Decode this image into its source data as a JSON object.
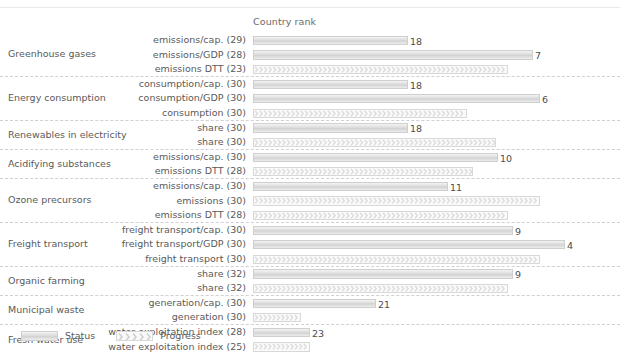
{
  "header": {
    "column_title": "Country rank"
  },
  "legend": {
    "status_label": "Status",
    "progress_label": "Progress",
    "status_swatch_icon": "solid-bar-swatch",
    "progress_swatch_icon": "chevron-bar-swatch"
  },
  "colors": {
    "status_fill": "#dcdcdc",
    "progress_fill": "#fafafa",
    "progress_chevron": "#dcdcdc",
    "bar_border": "#d2d2d2",
    "separator": "#cfcfd4",
    "text": "#5a5a5a",
    "background": "#ffffff"
  },
  "chart_data": {
    "type": "bar",
    "title": "",
    "xlabel": "Country rank",
    "ylabel": "",
    "grid": false,
    "legend_position": "bottom-left",
    "xlim": [
      1,
      32
    ],
    "note": "Horizontal bar chart; longer bar = better (lower) country rank. Two series: Status (solid) and Progress (chevron-hatched). Parenthetical number after each indicator label is the number of countries ranked.",
    "series": [
      {
        "name": "Status",
        "style": "solid"
      },
      {
        "name": "Progress",
        "style": "chevron"
      }
    ],
    "groups": [
      {
        "group": "Greenhouse gases",
        "rows": [
          {
            "label": "emissions/cap. (29)",
            "countries_ranked": 29,
            "series": "Status",
            "rank": 18,
            "bar_px": 155
          },
          {
            "label": "emissions/GDP (28)",
            "countries_ranked": 28,
            "series": "Status",
            "rank": 7,
            "bar_px": 280
          },
          {
            "label": "emissions DTT (23)",
            "countries_ranked": 23,
            "series": "Progress",
            "rank": 9,
            "bar_px": 255
          }
        ]
      },
      {
        "group": "Energy consumption",
        "rows": [
          {
            "label": "consumption/cap. (30)",
            "countries_ranked": 30,
            "series": "Status",
            "rank": 18,
            "bar_px": 155
          },
          {
            "label": "consumption/GDP (30)",
            "countries_ranked": 30,
            "series": "Status",
            "rank": 6,
            "bar_px": 287
          },
          {
            "label": "consumption (30)",
            "countries_ranked": 30,
            "series": "Progress",
            "rank": 13,
            "bar_px": 214
          }
        ]
      },
      {
        "group": "Renewables in electricity",
        "rows": [
          {
            "label": "share (30)",
            "countries_ranked": 30,
            "series": "Status",
            "rank": 18,
            "bar_px": 155
          },
          {
            "label": "share (30)",
            "countries_ranked": 30,
            "series": "Progress",
            "rank": 10,
            "bar_px": 243
          }
        ]
      },
      {
        "group": "Acidifying substances",
        "rows": [
          {
            "label": "emissions/cap. (30)",
            "countries_ranked": 30,
            "series": "Status",
            "rank": 10,
            "bar_px": 245
          },
          {
            "label": "emissions DTT (28)",
            "countries_ranked": 28,
            "series": "Progress",
            "rank": 12,
            "bar_px": 220
          }
        ]
      },
      {
        "group": "Ozone precursors",
        "rows": [
          {
            "label": "emissions/cap. (30)",
            "countries_ranked": 30,
            "series": "Status",
            "rank": 11,
            "bar_px": 195
          },
          {
            "label": "emissions (30)",
            "countries_ranked": 30,
            "series": "Progress",
            "rank": 6,
            "bar_px": 287
          },
          {
            "label": "emissions DTT (28)",
            "countries_ranked": 28,
            "series": "Progress",
            "rank": 9,
            "bar_px": 255
          }
        ]
      },
      {
        "group": "Freight transport",
        "rows": [
          {
            "label": "freight transport/cap. (30)",
            "countries_ranked": 30,
            "series": "Status",
            "rank": 9,
            "bar_px": 260
          },
          {
            "label": "freight transport/GDP (30)",
            "countries_ranked": 30,
            "series": "Status",
            "rank": 4,
            "bar_px": 312
          },
          {
            "label": "freight transport (30)",
            "countries_ranked": 30,
            "series": "Progress",
            "rank": 6,
            "bar_px": 287
          }
        ]
      },
      {
        "group": "Organic farming",
        "rows": [
          {
            "label": "share (32)",
            "countries_ranked": 32,
            "series": "Status",
            "rank": 9,
            "bar_px": 260
          },
          {
            "label": "share (32)",
            "countries_ranked": 32,
            "series": "Progress",
            "rank": 9,
            "bar_px": 255
          }
        ]
      },
      {
        "group": "Municipal waste",
        "rows": [
          {
            "label": "generation/cap. (30)",
            "countries_ranked": 30,
            "series": "Status",
            "rank": 21,
            "bar_px": 123
          },
          {
            "label": "generation (30)",
            "countries_ranked": 30,
            "series": "Progress",
            "rank": 27,
            "bar_px": 48
          }
        ]
      },
      {
        "group": "Fresh water use",
        "rows": [
          {
            "label": "water exploitation index (28)",
            "countries_ranked": 28,
            "series": "Status",
            "rank": 23,
            "bar_px": 57
          },
          {
            "label": "water exploitation index (25)",
            "countries_ranked": 25,
            "series": "Progress",
            "rank": 23,
            "bar_px": 57
          }
        ]
      }
    ]
  }
}
